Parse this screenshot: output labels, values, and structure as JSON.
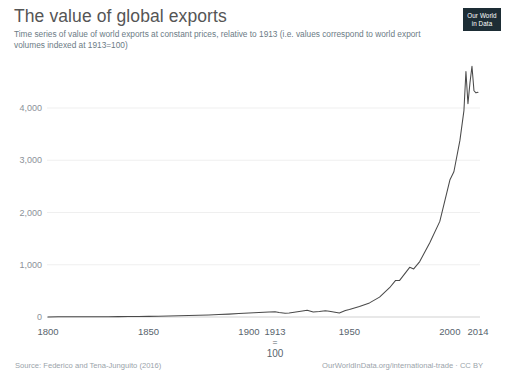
{
  "header": {
    "title": "The value of global exports",
    "subtitle": "Time series of value of world exports at constant prices, relative to 1913 (i.e. values correspond to world export volumes indexed at 1913=100)",
    "logo_line1": "Our World",
    "logo_line2": "in Data"
  },
  "footer": {
    "source": "Source: Federico and Tena-Junguito (2016)",
    "attribution": "OurWorldInData.org/international-trade · CC BY"
  },
  "annotation": {
    "year": "1913",
    "equals": "=",
    "value": "100"
  },
  "chart_data": {
    "type": "line",
    "title": "The value of global exports",
    "subtitle": "Time series of value of world exports at constant prices, relative to 1913 (i.e. values correspond to world export volumes indexed at 1913=100)",
    "xlabel": "",
    "ylabel": "",
    "xlim": [
      1800,
      2014
    ],
    "ylim": [
      0,
      4900
    ],
    "grid": "horizontal",
    "legend": "none",
    "xticks": [
      1800,
      1850,
      1900,
      1913,
      1950,
      2000,
      2014
    ],
    "xtick_labels": [
      "1800",
      "1850",
      "1900",
      "1913",
      "1950",
      "2000",
      "2014"
    ],
    "yticks": [
      0,
      1000,
      2000,
      3000,
      4000
    ],
    "ytick_labels": [
      "0",
      "1,000",
      "2,000",
      "3,000",
      "4,000"
    ],
    "line_color": "#4a4a4a",
    "series": [
      {
        "name": "World exports (1913=100)",
        "x": [
          1800,
          1805,
          1810,
          1815,
          1820,
          1825,
          1830,
          1835,
          1840,
          1845,
          1850,
          1855,
          1860,
          1865,
          1870,
          1875,
          1880,
          1885,
          1890,
          1895,
          1900,
          1905,
          1910,
          1913,
          1915,
          1918,
          1920,
          1925,
          1929,
          1932,
          1935,
          1938,
          1940,
          1945,
          1948,
          1950,
          1955,
          1960,
          1965,
          1970,
          1973,
          1975,
          1980,
          1982,
          1985,
          1990,
          1995,
          2000,
          2002,
          2005,
          2007,
          2008,
          2009,
          2010,
          2011,
          2012,
          2013,
          2014
        ],
        "values": [
          2,
          3,
          3,
          4,
          4,
          5,
          6,
          7,
          8,
          10,
          12,
          15,
          19,
          22,
          28,
          33,
          40,
          46,
          55,
          65,
          76,
          88,
          96,
          100,
          86,
          70,
          78,
          105,
          130,
          95,
          105,
          118,
          110,
          78,
          125,
          145,
          200,
          270,
          380,
          560,
          700,
          700,
          950,
          920,
          1060,
          1420,
          1830,
          2620,
          2780,
          3380,
          3950,
          4700,
          4080,
          4480,
          4800,
          4330,
          4290,
          4300
        ]
      }
    ]
  }
}
